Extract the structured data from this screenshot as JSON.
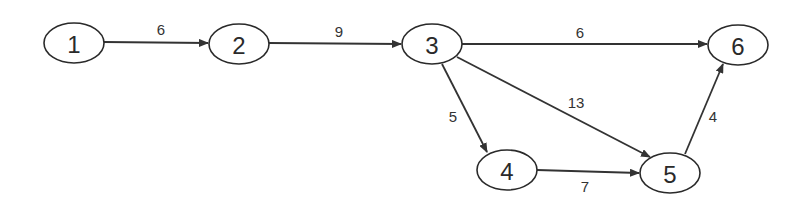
{
  "diagram": {
    "type": "directed-weighted-graph",
    "colors": {
      "stroke": "#2a2a2a",
      "background": "#ffffff"
    },
    "nodes": [
      {
        "id": "1",
        "label": "1",
        "cx": 74,
        "cy": 43,
        "rx": 30,
        "ry": 20
      },
      {
        "id": "2",
        "label": "2",
        "cx": 239,
        "cy": 44,
        "rx": 30,
        "ry": 20
      },
      {
        "id": "3",
        "label": "3",
        "cx": 432,
        "cy": 44,
        "rx": 30,
        "ry": 20
      },
      {
        "id": "6",
        "label": "6",
        "cx": 738,
        "cy": 45,
        "rx": 30,
        "ry": 20
      },
      {
        "id": "4",
        "label": "4",
        "cx": 507,
        "cy": 170,
        "rx": 30,
        "ry": 20
      },
      {
        "id": "5",
        "label": "5",
        "cx": 670,
        "cy": 173,
        "rx": 30,
        "ry": 20
      }
    ],
    "edges": [
      {
        "from": "1",
        "to": "2",
        "weight": "6",
        "x1": 104,
        "y1": 42,
        "x2": 208,
        "y2": 43,
        "lx": 161,
        "ly": 29
      },
      {
        "from": "2",
        "to": "3",
        "weight": "9",
        "x1": 269,
        "y1": 43,
        "x2": 401,
        "y2": 44,
        "lx": 339,
        "ly": 31
      },
      {
        "from": "3",
        "to": "6",
        "weight": "6",
        "x1": 462,
        "y1": 44,
        "x2": 707,
        "y2": 44,
        "lx": 580,
        "ly": 32
      },
      {
        "from": "3",
        "to": "4",
        "weight": "5",
        "x1": 442,
        "y1": 64,
        "x2": 487,
        "y2": 152,
        "lx": 453,
        "ly": 116
      },
      {
        "from": "3",
        "to": "5",
        "weight": "13",
        "x1": 457,
        "y1": 57,
        "x2": 650,
        "y2": 157,
        "lx": 576,
        "ly": 102
      },
      {
        "from": "4",
        "to": "5",
        "weight": "7",
        "x1": 537,
        "y1": 170,
        "x2": 639,
        "y2": 173,
        "lx": 585,
        "ly": 186
      },
      {
        "from": "5",
        "to": "6",
        "weight": "4",
        "x1": 685,
        "y1": 154,
        "x2": 723,
        "y2": 64,
        "lx": 713,
        "ly": 116
      }
    ]
  }
}
